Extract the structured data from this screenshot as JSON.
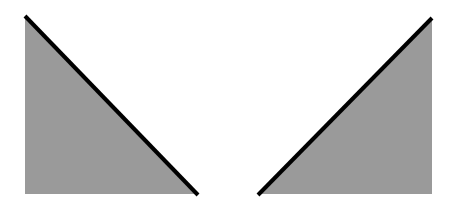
{
  "figure": {
    "width": 457,
    "height": 203,
    "background": "#ffffff",
    "shapes": [
      {
        "id": "left-triangle",
        "type": "right-triangle",
        "fill": "#9a9a9a",
        "stroke": "#000000",
        "stroke_width": 4,
        "points": [
          [
            25,
            16
          ],
          [
            25,
            194
          ],
          [
            198,
            194
          ]
        ],
        "hypotenuse": [
          [
            25,
            16
          ],
          [
            198,
            195
          ]
        ]
      },
      {
        "id": "right-triangle",
        "type": "right-triangle",
        "fill": "#9a9a9a",
        "stroke": "#000000",
        "stroke_width": 4,
        "points": [
          [
            432,
            18
          ],
          [
            432,
            194
          ],
          [
            258,
            194
          ]
        ],
        "hypotenuse": [
          [
            432,
            18
          ],
          [
            258,
            195
          ]
        ]
      }
    ]
  }
}
